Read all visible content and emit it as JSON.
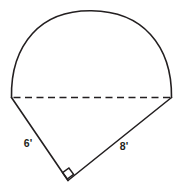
{
  "figure": {
    "background_color": "#ffffff",
    "stroke_color": "#231f20",
    "labels": {
      "leg_left": "6'",
      "leg_right": "8'"
    },
    "geometry": {
      "chord_left_point": [
        11,
        97
      ],
      "chord_right_point": [
        172,
        97
      ],
      "arc_apex": [
        91,
        11
      ],
      "triangle_apex": [
        68,
        180
      ],
      "arc_radius": 82,
      "chord_length_px": 161,
      "right_angle_vertex": [
        68,
        180
      ],
      "right_angle_marker_size": 9
    },
    "elements": {
      "arc_name": "semicircle-arc",
      "chord_name": "diameter-dashed-line",
      "leg_left_name": "triangle-leg-left",
      "leg_right_name": "triangle-leg-right",
      "angle_name": "right-angle-marker"
    }
  }
}
